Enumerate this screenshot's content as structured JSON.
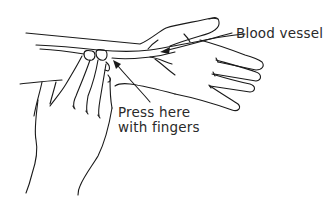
{
  "figure": {
    "labels": {
      "blood_vessel": "Blood vessel",
      "press_line1": "Press here",
      "press_line2": "with fingers"
    },
    "colors": {
      "ink": "#1a1a1a",
      "text": "#2a2a2a",
      "background": "#ffffff"
    }
  }
}
